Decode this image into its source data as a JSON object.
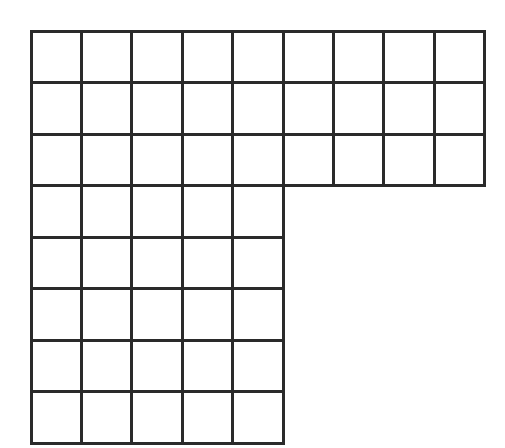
{
  "figure": {
    "shape_name": "L-shaped grid figure",
    "background_color": "#ffffff",
    "line_color": "#2a2a2a",
    "line_width": 3,
    "canvas": {
      "width": 505,
      "height": 448
    }
  },
  "chart_data": {
    "type": "diagram",
    "subtype": "unit-square-grid-polyomino",
    "xlabel": "",
    "ylabel": "",
    "grid": true,
    "legend": "none",
    "origin": {
      "x": 31,
      "y": 31
    },
    "cell_width": 50.4,
    "cell_height": 51.5,
    "rows": 8,
    "columns": 9,
    "total_cells": 52,
    "row_widths": [
      9,
      9,
      9,
      5,
      5,
      5,
      5,
      5
    ],
    "bands": [
      {
        "name": "top-band",
        "rows": 3,
        "columns": 9,
        "cells": 27,
        "x_range": [
          31,
          485
        ],
        "y_range": [
          31,
          187
        ]
      },
      {
        "name": "bottom-leg",
        "rows": 5,
        "columns": 5,
        "cells": 25,
        "x_range": [
          31,
          283
        ],
        "y_range": [
          187,
          443
        ]
      }
    ],
    "filled_cells": [
      [
        0,
        0
      ],
      [
        0,
        1
      ],
      [
        0,
        2
      ],
      [
        0,
        3
      ],
      [
        0,
        4
      ],
      [
        0,
        5
      ],
      [
        0,
        6
      ],
      [
        0,
        7
      ],
      [
        0,
        8
      ],
      [
        1,
        0
      ],
      [
        1,
        1
      ],
      [
        1,
        2
      ],
      [
        1,
        3
      ],
      [
        1,
        4
      ],
      [
        1,
        5
      ],
      [
        1,
        6
      ],
      [
        1,
        7
      ],
      [
        1,
        8
      ],
      [
        2,
        0
      ],
      [
        2,
        1
      ],
      [
        2,
        2
      ],
      [
        2,
        3
      ],
      [
        2,
        4
      ],
      [
        2,
        5
      ],
      [
        2,
        6
      ],
      [
        2,
        7
      ],
      [
        2,
        8
      ],
      [
        3,
        0
      ],
      [
        3,
        1
      ],
      [
        3,
        2
      ],
      [
        3,
        3
      ],
      [
        3,
        4
      ],
      [
        4,
        0
      ],
      [
        4,
        1
      ],
      [
        4,
        2
      ],
      [
        4,
        3
      ],
      [
        4,
        4
      ],
      [
        5,
        0
      ],
      [
        5,
        1
      ],
      [
        5,
        2
      ],
      [
        5,
        3
      ],
      [
        5,
        4
      ],
      [
        6,
        0
      ],
      [
        6,
        1
      ],
      [
        6,
        2
      ],
      [
        6,
        3
      ],
      [
        6,
        4
      ],
      [
        7,
        0
      ],
      [
        7,
        1
      ],
      [
        7,
        2
      ],
      [
        7,
        3
      ],
      [
        7,
        4
      ]
    ],
    "outline_vertices": [
      [
        31,
        31
      ],
      [
        485,
        31
      ],
      [
        485,
        187
      ],
      [
        283,
        187
      ],
      [
        283,
        443
      ],
      [
        31,
        443
      ]
    ],
    "perimeter_units": 32,
    "area_units": 52
  }
}
